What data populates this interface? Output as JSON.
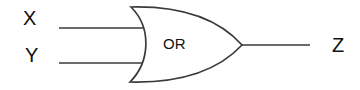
{
  "diagram": {
    "type": "logic-gate",
    "gate": {
      "kind": "OR",
      "label": "OR"
    },
    "inputs": [
      {
        "label": "X"
      },
      {
        "label": "Y"
      }
    ],
    "output": {
      "label": "Z"
    },
    "colors": {
      "stroke": "#3a3a3a",
      "text": "#111111",
      "background": "#ffffff"
    }
  }
}
